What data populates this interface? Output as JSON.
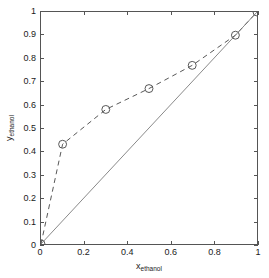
{
  "chart_data": {
    "type": "line",
    "title": "",
    "xlabel": "x_ethanol",
    "ylabel": "y_ethanol",
    "xlabel_base": "x",
    "xlabel_sub": "ethanol",
    "ylabel_base": "y",
    "ylabel_sub": "ethanol",
    "xlim": [
      0,
      1
    ],
    "ylim": [
      0,
      1
    ],
    "grid": false,
    "legend": null,
    "xticks": [
      0,
      0.2,
      0.4,
      0.6,
      0.8,
      1
    ],
    "xticklabels": [
      "0",
      "0.2",
      "0.4",
      "0.6",
      "0.8",
      "1"
    ],
    "yticks": [
      0,
      0.1,
      0.2,
      0.3,
      0.4,
      0.5,
      0.6,
      0.7,
      0.8,
      0.9,
      1
    ],
    "yticklabels": [
      "0",
      "0.1",
      "0.2",
      "0.3",
      "0.4",
      "0.5",
      "0.6",
      "0.7",
      "0.8",
      "0.9",
      "1"
    ],
    "series": [
      {
        "name": "equilibrium-curve",
        "style": "dashed",
        "marker": "circle",
        "color": "#555555",
        "x": [
          0,
          0.1,
          0.3,
          0.5,
          0.7,
          0.9,
          1
        ],
        "y": [
          0,
          0.43,
          0.58,
          0.67,
          0.77,
          0.9,
          1
        ]
      },
      {
        "name": "diagonal-reference-line",
        "style": "solid",
        "marker": "none",
        "color": "#7a7a7a",
        "x": [
          0,
          1
        ],
        "y": [
          0,
          1
        ]
      }
    ]
  }
}
